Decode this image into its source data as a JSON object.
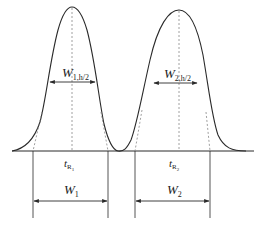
{
  "diagram": {
    "type": "chromatogram-peak-resolution",
    "colors": {
      "stroke": "#2a2a2a",
      "dashed": "#888888",
      "background": "#ffffff"
    },
    "peaks": [
      {
        "id": "peak-1",
        "retention_label_main": "t",
        "retention_label_sub": "R",
        "retention_label_subsub": "1",
        "half_width_label_main": "W",
        "half_width_label_sub": "1,h/2",
        "base_width_label_main": "W",
        "base_width_label_sub": "1"
      },
      {
        "id": "peak-2",
        "retention_label_main": "t",
        "retention_label_sub": "R",
        "retention_label_subsub": "2",
        "half_width_label_main": "W",
        "half_width_label_sub": "2,h/2",
        "base_width_label_main": "W",
        "base_width_label_sub": "2"
      }
    ]
  }
}
